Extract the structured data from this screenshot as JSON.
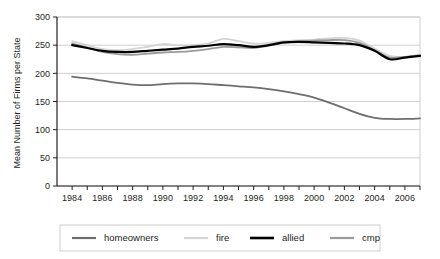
{
  "chart_data": {
    "type": "line",
    "title": "",
    "xlabel": "",
    "ylabel": "Mean Number of  Firms per State",
    "xlim": [
      1983,
      2007
    ],
    "ylim": [
      0,
      300
    ],
    "yticks": [
      0,
      50,
      100,
      150,
      200,
      250,
      300
    ],
    "ytick_labels": [
      "0",
      "50",
      "100",
      "150",
      "200",
      "250",
      "300"
    ],
    "xticks": [
      1984,
      1986,
      1988,
      1990,
      1992,
      1994,
      1996,
      1998,
      2000,
      2002,
      2004,
      2006
    ],
    "xtick_labels": [
      "1984",
      "1986",
      "1988",
      "1990",
      "1992",
      "1994",
      "1996",
      "1998",
      "2000",
      "2002",
      "2004",
      "2006"
    ],
    "x": [
      1984,
      1985,
      1986,
      1987,
      1988,
      1989,
      1990,
      1991,
      1992,
      1993,
      1994,
      1995,
      1996,
      1997,
      1998,
      1999,
      2000,
      2001,
      2002,
      2003,
      2004,
      2005,
      2006,
      2007
    ],
    "grid": "horizontal",
    "legend_position": "bottom",
    "series": [
      {
        "name": "homeowners",
        "color": "#6e6e6e",
        "width": 1.8,
        "values": [
          194,
          191,
          187,
          183,
          180,
          179,
          181,
          182,
          182,
          181,
          179,
          177,
          175,
          172,
          168,
          163,
          157,
          148,
          138,
          128,
          121,
          119,
          119,
          120
        ]
      },
      {
        "name": "fire",
        "color": "#d4d4d4",
        "width": 1.8,
        "values": [
          257,
          250,
          243,
          241,
          243,
          247,
          252,
          250,
          250,
          253,
          261,
          257,
          253,
          254,
          257,
          259,
          260,
          262,
          263,
          258,
          244,
          231,
          229,
          233
        ]
      },
      {
        "name": "allied",
        "color": "#000000",
        "width": 2.2,
        "values": [
          250,
          245,
          240,
          238,
          238,
          240,
          242,
          244,
          247,
          249,
          252,
          250,
          247,
          250,
          255,
          256,
          255,
          254,
          253,
          250,
          240,
          225,
          228,
          231
        ]
      },
      {
        "name": "cmp",
        "color": "#9a9a9a",
        "width": 1.8,
        "values": [
          253,
          246,
          238,
          234,
          233,
          235,
          237,
          238,
          240,
          243,
          247,
          246,
          245,
          249,
          254,
          257,
          258,
          259,
          259,
          254,
          241,
          228,
          229,
          232
        ]
      }
    ]
  },
  "legend": {
    "items": [
      {
        "label": "homeowners"
      },
      {
        "label": "fire"
      },
      {
        "label": "allied"
      },
      {
        "label": "cmp"
      }
    ]
  },
  "axes": {
    "y_title": "Mean Number of  Firms per State"
  },
  "colors": {
    "axis": "#231f20",
    "grid": "#c9c9c9",
    "background": "#ffffff",
    "legend_border": "#c9c9c9"
  }
}
